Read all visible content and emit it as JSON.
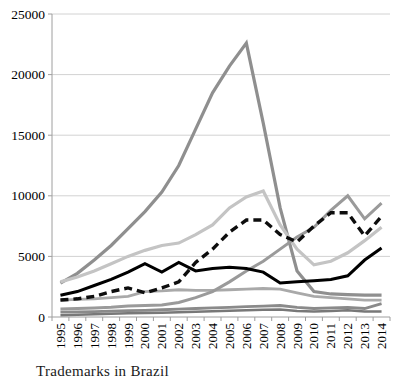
{
  "chart_data": {
    "type": "line",
    "title": "",
    "x_categories": [
      "1995",
      "1996",
      "1997",
      "1998",
      "1999",
      "2000",
      "2001",
      "2002",
      "2003",
      "2004",
      "2005",
      "2006",
      "2007",
      "2008",
      "2009",
      "2010",
      "2011",
      "2012",
      "2013",
      "2014"
    ],
    "y_axis": {
      "min": 0,
      "max": 25000,
      "step": 5000,
      "tick_labels": [
        "0",
        "5000",
        "10000",
        "15000",
        "20000",
        "25000"
      ]
    },
    "x_tick_label_rotation": -90,
    "grid": true,
    "legend": "none",
    "series": [
      {
        "name": "gray-steep-peak-2006",
        "color": "#8f8f8f",
        "style": "solid",
        "width": 3.2,
        "values": [
          2800,
          3600,
          4700,
          5900,
          7300,
          8700,
          10300,
          12500,
          15500,
          18500,
          20700,
          22600,
          16000,
          9000,
          3800,
          2100,
          1900,
          1850,
          1800,
          1800
        ]
      },
      {
        "name": "light-gray-peak-2007",
        "color": "#c4c4c4",
        "style": "solid",
        "width": 3.2,
        "values": [
          2900,
          3300,
          3800,
          4400,
          5000,
          5500,
          5900,
          6100,
          6800,
          7600,
          9000,
          9900,
          10400,
          7600,
          5600,
          4300,
          4600,
          5300,
          6300,
          7400
        ]
      },
      {
        "name": "gray-hump-mid",
        "color": "#a9a9a9",
        "style": "solid",
        "width": 2.8,
        "values": [
          1400,
          1450,
          1500,
          1600,
          1700,
          2100,
          2150,
          2250,
          2200,
          2200,
          2250,
          2300,
          2350,
          2300,
          2000,
          1700,
          1600,
          1500,
          1400,
          1400
        ]
      },
      {
        "name": "gray-late-riser-peak-2012",
        "color": "#9a9a9a",
        "style": "solid",
        "width": 3,
        "values": [
          650,
          700,
          750,
          800,
          900,
          950,
          1000,
          1200,
          1600,
          2100,
          2900,
          3800,
          4600,
          5600,
          6600,
          7400,
          8800,
          10000,
          8100,
          9400
        ]
      },
      {
        "name": "gray-low",
        "color": "#8a8a8a",
        "style": "solid",
        "width": 2.8,
        "values": [
          400,
          420,
          450,
          480,
          520,
          550,
          600,
          650,
          700,
          750,
          800,
          850,
          900,
          950,
          800,
          700,
          750,
          800,
          700,
          1100
        ]
      },
      {
        "name": "gray-lowest",
        "color": "#787878",
        "style": "solid",
        "width": 2.5,
        "values": [
          150,
          180,
          220,
          260,
          300,
          330,
          360,
          400,
          440,
          480,
          520,
          560,
          600,
          620,
          500,
          450,
          500,
          550,
          450,
          450
        ]
      },
      {
        "name": "black-solid",
        "color": "#000000",
        "style": "solid",
        "width": 3,
        "values": [
          1800,
          2100,
          2600,
          3100,
          3700,
          4400,
          3700,
          4500,
          3800,
          4000,
          4100,
          4000,
          3700,
          2800,
          2900,
          3000,
          3100,
          3400,
          4700,
          5700
        ]
      },
      {
        "name": "black-dashed",
        "color": "#0d0d0d",
        "style": "dashed",
        "width": 3.4,
        "values": [
          1400,
          1500,
          1700,
          2100,
          2400,
          2000,
          2400,
          2900,
          4500,
          5600,
          7000,
          8000,
          8000,
          6800,
          6200,
          7500,
          8600,
          8600,
          6700,
          8300
        ]
      }
    ]
  },
  "caption": {
    "text": "Trademarks in Brazil"
  },
  "colors": {
    "grid": "#d2d2d2",
    "axis": "#9e9e9e",
    "label": "#000000",
    "background": "#ffffff"
  }
}
